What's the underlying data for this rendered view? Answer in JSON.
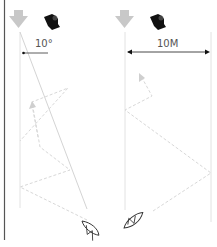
{
  "diagram": {
    "type": "sailing-tactics",
    "panels": [
      {
        "id": "left",
        "angle_label": "10°",
        "wind_arrow": "wind-direction-arrow",
        "gust_icon": "wind-gust-icon",
        "boat": "sailboat"
      },
      {
        "id": "right",
        "distance_label": "10M",
        "wind_arrow": "wind-direction-arrow",
        "gust_icon": "wind-gust-icon",
        "boat": "sailboat"
      }
    ],
    "colors": {
      "wind_arrow": "#c8c8c8",
      "gust": "#111111",
      "lines": "#d6d6d6",
      "dashed": "#d9d9d9",
      "measure": "#333333",
      "boat": "#333333",
      "border": "#444444"
    }
  }
}
